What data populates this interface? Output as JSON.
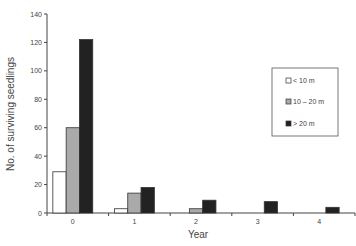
{
  "chart_data": {
    "type": "bar",
    "title": "",
    "xlabel": "Year",
    "ylabel": "No. of surviving seedlings",
    "ylim": [
      0,
      140
    ],
    "yticks": [
      0,
      20,
      40,
      60,
      80,
      100,
      120,
      140
    ],
    "categories": [
      "0",
      "1",
      "2",
      "3",
      "4"
    ],
    "series": [
      {
        "name": "< 10 m",
        "color": "#ffffff",
        "values": [
          29,
          3,
          0,
          0,
          0
        ]
      },
      {
        "name": "10 – 20 m",
        "color": "#aaaaaa",
        "values": [
          60,
          14,
          3,
          0,
          0
        ]
      },
      {
        "name": "> 20 m",
        "color": "#222222",
        "values": [
          122,
          18,
          9,
          8,
          4
        ]
      }
    ],
    "grid": false,
    "legend_position": "right"
  }
}
